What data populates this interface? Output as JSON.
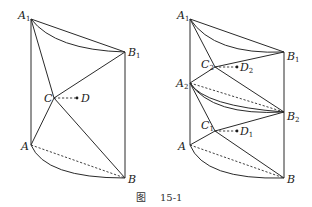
{
  "caption": {
    "prefix": "图",
    "number": "15-1"
  },
  "left_figure": {
    "labels": {
      "A1": {
        "base": "A",
        "sub": "1"
      },
      "B1": {
        "base": "B",
        "sub": "1"
      },
      "C": {
        "base": "C"
      },
      "D": {
        "base": "D"
      },
      "A": {
        "base": "A"
      },
      "B": {
        "base": "B"
      }
    },
    "points": {
      "A1": [
        31,
        19
      ],
      "B1": [
        125,
        52
      ],
      "C": [
        54,
        98
      ],
      "D": [
        77,
        98
      ],
      "A": [
        31,
        145
      ],
      "B": [
        125,
        178
      ]
    }
  },
  "right_figure": {
    "labels": {
      "A1": {
        "base": "A",
        "sub": "1"
      },
      "B1": {
        "base": "B",
        "sub": "1"
      },
      "C2": {
        "base": "C",
        "sub": "2"
      },
      "D2": {
        "base": "D",
        "sub": "2"
      },
      "A2": {
        "base": "A",
        "sub": "2"
      },
      "B2": {
        "base": "B",
        "sub": "2"
      },
      "C1": {
        "base": "C",
        "sub": "1"
      },
      "D1": {
        "base": "D",
        "sub": "1"
      },
      "A": {
        "base": "A"
      },
      "B": {
        "base": "B"
      }
    },
    "points": {
      "A1": [
        190,
        19
      ],
      "B1": [
        284,
        52
      ],
      "C2": [
        215,
        67
      ],
      "D2": [
        237,
        67
      ],
      "A2": [
        190,
        83
      ],
      "B2": [
        284,
        112
      ],
      "C1": [
        215,
        131
      ],
      "D1": [
        237,
        131
      ],
      "A": [
        190,
        145
      ],
      "B": [
        284,
        178
      ]
    }
  }
}
